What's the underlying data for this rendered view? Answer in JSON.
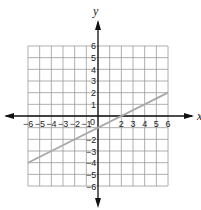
{
  "chart_data": {
    "type": "line",
    "title": "",
    "xlabel": "x",
    "ylabel": "y",
    "xlim": [
      -6,
      6
    ],
    "ylim": [
      -6,
      6
    ],
    "grid": true,
    "x_ticks": [
      -6,
      -5,
      -4,
      -3,
      -2,
      -1,
      0,
      2,
      3,
      4,
      5,
      6
    ],
    "y_ticks": [
      6,
      5,
      4,
      3,
      2,
      1,
      -2,
      -3,
      -4,
      -5,
      -6
    ],
    "series": [
      {
        "name": "line",
        "equation": "y = 0.5x - 1",
        "x": [
          -6,
          6
        ],
        "y": [
          -4,
          2
        ],
        "color": "#a8a8a8"
      }
    ]
  },
  "colors": {
    "grid": "#9a9a9a",
    "axis": "#111111",
    "line": "#a8a8a8"
  }
}
